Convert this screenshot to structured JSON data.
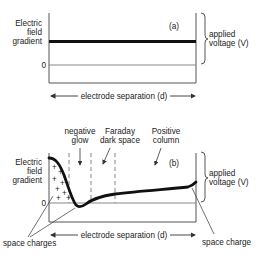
{
  "panel_a": {
    "tag": "(a)",
    "y_label_lines": [
      "Electric",
      "field",
      "gradient"
    ],
    "zero_label": "0",
    "brace_label_lines": [
      "applied",
      "voltage (V)"
    ],
    "x_label": "electrode separation (d)"
  },
  "panel_b": {
    "tag": "(b)",
    "y_label_lines": [
      "Electric",
      "field",
      "gradient"
    ],
    "zero_label": "0",
    "brace_label_lines": [
      "applied",
      "voltage (V)"
    ],
    "x_label": "electrode separation (d)",
    "regions": [
      {
        "lines": [
          "negative",
          "glow"
        ]
      },
      {
        "lines": [
          "Faraday",
          "dark space"
        ]
      },
      {
        "lines": [
          "Positive",
          "column"
        ]
      }
    ],
    "callouts": {
      "left": "space charges",
      "right": "space charge"
    },
    "plus_sign": "+"
  },
  "colors": {
    "ink": "#1a1a1a",
    "axis": "#555555",
    "dash": "#777777"
  }
}
